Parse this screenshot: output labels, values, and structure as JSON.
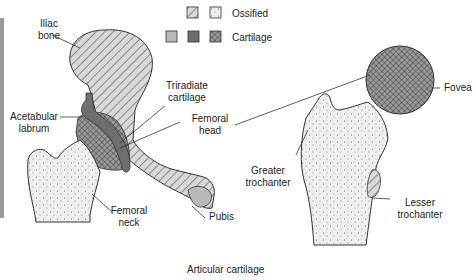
{
  "legend": {
    "ossified_label": "Ossified",
    "cartilage_label": "Cartilage",
    "ossified_swatches": [
      "hatched",
      "stippled"
    ],
    "cartilage_swatches": [
      "light-gray",
      "dark-gray",
      "crosshatched"
    ]
  },
  "left_figure": {
    "labels": {
      "iliac_bone_1": "Iliac",
      "iliac_bone_2": "bone",
      "acetabular_labrum_1": "Acetabular",
      "acetabular_labrum_2": "labrum",
      "triradiate_1": "Triradiate",
      "triradiate_2": "cartilage",
      "femoral_head_1": "Femoral",
      "femoral_head_2": "head",
      "femoral_neck_1": "Femoral",
      "femoral_neck_2": "neck",
      "pubis": "Pubis"
    }
  },
  "right_figure": {
    "labels": {
      "fovea": "Fovea",
      "greater_trochanter_1": "Greater",
      "greater_trochanter_2": "trochanter",
      "lesser_trochanter_1": "Lesser",
      "lesser_trochanter_2": "trochanter"
    }
  },
  "footer": {
    "articular_cartilage": "Articular cartilage"
  },
  "colors": {
    "hatch_fill": "#d6d6d6",
    "stipple_fill": "#eeeeee",
    "dark_cartilage": "#6e6e6e",
    "light_cartilage": "#b8b8b8",
    "outline": "#333333"
  }
}
